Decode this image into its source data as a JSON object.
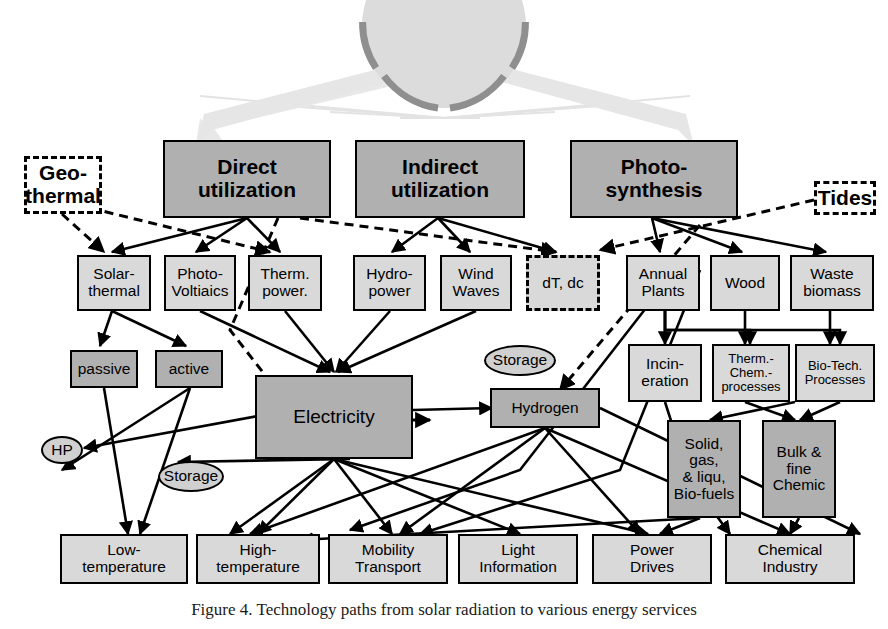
{
  "figure": {
    "caption": "Figure 4. Technology paths from solar radiation to various energy services",
    "sun_label": "sun"
  },
  "colors": {
    "box_mid": "#b0b0b0",
    "box_light": "#d9d9d9",
    "box_white": "#ffffff",
    "ellipse": "#d0d0d0",
    "outline": "#000000",
    "sun_fill": "#d8d8d8",
    "sun_ring": "#8a8a8a",
    "sun_ray": "#e3e3e3"
  },
  "nodes": {
    "geothermal": {
      "label": "Geo-\nthermal",
      "style": "dashed-white",
      "x": 24,
      "y": 156,
      "w": 78,
      "h": 58
    },
    "direct": {
      "label": "Direct\nutilization",
      "style": "mid",
      "x": 163,
      "y": 140,
      "w": 168,
      "h": 78
    },
    "indirect": {
      "label": "Indirect\nutilization",
      "style": "mid",
      "x": 355,
      "y": 140,
      "w": 170,
      "h": 78
    },
    "photosynth": {
      "label": "Photo-\nsynthesis",
      "style": "mid",
      "x": 570,
      "y": 140,
      "w": 168,
      "h": 78
    },
    "tides": {
      "label": "Tides",
      "style": "dashed-white",
      "x": 814,
      "y": 181,
      "w": 62,
      "h": 34
    },
    "solarthermal": {
      "label": "Solar-\nthermal",
      "style": "light",
      "x": 77,
      "y": 255,
      "w": 74,
      "h": 56
    },
    "photovoltaics": {
      "label": "Photo-\nVoltiaics",
      "style": "light",
      "x": 164,
      "y": 255,
      "w": 72,
      "h": 56
    },
    "thermpower": {
      "label": "Therm.\npower.",
      "style": "light",
      "x": 248,
      "y": 255,
      "w": 74,
      "h": 56
    },
    "hydropower": {
      "label": "Hydro-\npower",
      "style": "light",
      "x": 353,
      "y": 255,
      "w": 73,
      "h": 56
    },
    "windwaves": {
      "label": "Wind\nWaves",
      "style": "light",
      "x": 440,
      "y": 255,
      "w": 72,
      "h": 56
    },
    "dtdc": {
      "label": "dT, dc",
      "style": "dashed-light",
      "x": 526,
      "y": 255,
      "w": 74,
      "h": 56
    },
    "annualplants": {
      "label": "Annual\nPlants",
      "style": "light",
      "x": 626,
      "y": 255,
      "w": 74,
      "h": 56
    },
    "wood": {
      "label": "Wood",
      "style": "light",
      "x": 710,
      "y": 255,
      "w": 70,
      "h": 56
    },
    "wastebiomass": {
      "label": "Waste\nbiomass",
      "style": "light",
      "x": 790,
      "y": 255,
      "w": 84,
      "h": 56
    },
    "passive": {
      "label": "passive",
      "style": "mid",
      "x": 70,
      "y": 350,
      "w": 68,
      "h": 38
    },
    "active": {
      "label": "active",
      "style": "mid",
      "x": 155,
      "y": 350,
      "w": 68,
      "h": 38
    },
    "incineration": {
      "label": "Incin-\neration",
      "style": "light",
      "x": 628,
      "y": 344,
      "w": 74,
      "h": 58
    },
    "thermchem": {
      "label": "Therm.-\nChem.-\nprocesses",
      "style": "light",
      "x": 712,
      "y": 344,
      "w": 78,
      "h": 58
    },
    "biotech": {
      "label": "Bio-Tech.\nProcesses",
      "style": "light",
      "x": 795,
      "y": 344,
      "w": 80,
      "h": 58
    },
    "electricity": {
      "label": "Electricity",
      "style": "mid",
      "x": 255,
      "y": 375,
      "w": 158,
      "h": 84
    },
    "hydrogen": {
      "label": "Hydrogen",
      "style": "mid",
      "x": 490,
      "y": 388,
      "w": 110,
      "h": 40
    },
    "biofuels": {
      "label": "Solid,\ngas,\n& liqu,\nBio-fuels",
      "style": "mid",
      "x": 667,
      "y": 420,
      "w": 74,
      "h": 98
    },
    "bulkchem": {
      "label": "Bulk &\nfine\nChemic",
      "style": "mid",
      "x": 762,
      "y": 420,
      "w": 74,
      "h": 98
    },
    "hp": {
      "label": "HP",
      "style": "ellipse",
      "x": 41,
      "y": 436,
      "w": 42,
      "h": 28
    },
    "storage_elec": {
      "label": "Storage",
      "style": "ellipse",
      "x": 158,
      "y": 461,
      "w": 66,
      "h": 31
    },
    "storage_h2": {
      "label": "Storage",
      "style": "ellipse",
      "x": 484,
      "y": 345,
      "w": 72,
      "h": 31
    },
    "lowtemp": {
      "label": "Low-\ntemperature",
      "style": "light",
      "x": 60,
      "y": 534,
      "w": 128,
      "h": 50
    },
    "hightemp": {
      "label": "High-\ntemperature",
      "style": "light",
      "x": 196,
      "y": 534,
      "w": 124,
      "h": 50
    },
    "mobility": {
      "label": "Mobility\nTransport",
      "style": "light",
      "x": 328,
      "y": 534,
      "w": 120,
      "h": 50
    },
    "light": {
      "label": "Light\nInformation",
      "style": "light",
      "x": 458,
      "y": 534,
      "w": 120,
      "h": 50
    },
    "power": {
      "label": "Power\nDrives",
      "style": "light",
      "x": 592,
      "y": 534,
      "w": 120,
      "h": 50
    },
    "chemindustry": {
      "label": "Chemical\nIndustry",
      "style": "light",
      "x": 725,
      "y": 534,
      "w": 130,
      "h": 50
    }
  },
  "edges": {
    "solid": [
      "M247,218 L112,252",
      "M247,218 L196,252",
      "M247,218 L280,252",
      "M438,218 L392,252",
      "M438,218 L470,252",
      "M438,218 L556,252",
      "M652,218 L660,252",
      "M652,218 L742,252",
      "M652,218 L826,252",
      "M112,311 L100,346",
      "M112,311 L186,346",
      "M200,311 L330,372",
      "M285,311 L334,372",
      "M390,311 L336,372",
      "M476,311 L338,372",
      "M104,388 L128,534",
      "M190,388 L140,534",
      "M190,388 L62,470",
      "M258,416 L84,448",
      "M334,459 L230,534",
      "M334,459 L258,534",
      "M334,459 L392,534",
      "M334,459 L520,534",
      "M334,459 L648,534",
      "M350,459 L178,462",
      "M413,410 L492,408",
      "M545,428 L250,534",
      "M545,428 L400,534",
      "M545,428 L640,534",
      "M545,428 L790,534",
      "M600,408 L860,534",
      "M665,311 L665,330 L840,330 L840,344",
      "M665,311 L665,330 L750,330 L750,344",
      "M665,311 L665,344",
      "M745,311 L745,344",
      "M830,311 L830,344",
      "M665,402 L690,480 L730,534",
      "M745,402 L795,420",
      "M795,402 L710,420",
      "M840,402 L800,420",
      "M700,518 L300,540",
      "M700,518 L660,534",
      "M799,518 L790,534",
      "M660,290 L520,470 L350,530",
      "M700,270 L620,470 L420,534"
    ],
    "dashed": [
      "M62,214 L104,252",
      "M90,208 L270,252",
      "M278,218 L230,330 L300,420 L430,420",
      "M300,218 L556,252",
      "M814,200 L600,250",
      "M700,225 L560,390"
    ]
  },
  "sun_rays": [
    [
      444,
      118,
      200,
      96
    ],
    [
      444,
      118,
      260,
      104
    ],
    [
      444,
      118,
      330,
      112
    ],
    [
      444,
      118,
      400,
      118
    ],
    [
      444,
      118,
      480,
      118
    ],
    [
      444,
      118,
      555,
      112
    ],
    [
      444,
      118,
      625,
      104
    ],
    [
      444,
      118,
      690,
      96
    ]
  ]
}
